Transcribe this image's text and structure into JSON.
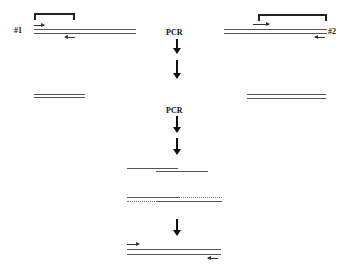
{
  "template1": {
    "label": "#1"
  },
  "template2": {
    "label": "#2"
  },
  "step1": {
    "label": "PCR"
  },
  "step2": {
    "label": "PCR"
  }
}
